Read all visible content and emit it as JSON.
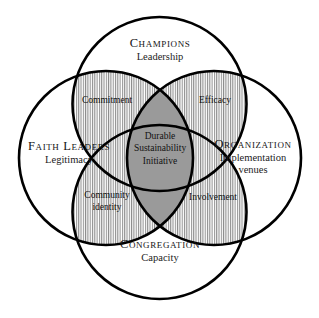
{
  "diagram": {
    "type": "four-circle-venn",
    "background_color": "#ffffff",
    "stroke_color": "#000000",
    "center_fill_color": "#9a9a9a",
    "hatch_color": "#8c8c8c",
    "nodes": [
      {
        "id": "champions",
        "position": "top",
        "title": "Champions",
        "subtitle": "Leadership"
      },
      {
        "id": "faith-leaders",
        "position": "left",
        "title": "Faith Leaders",
        "subtitle": "Legitimacy"
      },
      {
        "id": "organization",
        "position": "right",
        "title": "Organization",
        "subtitle_line1": "Implementation",
        "subtitle_line2": "venues"
      },
      {
        "id": "congregation",
        "position": "bottom",
        "title": "Congregation",
        "subtitle": "Capacity"
      }
    ],
    "intersections": [
      {
        "id": "commitment",
        "position": "top-left",
        "between": [
          "champions",
          "faith-leaders"
        ],
        "label": "Commitment",
        "fill": "hatched"
      },
      {
        "id": "efficacy",
        "position": "top-right",
        "between": [
          "champions",
          "organization"
        ],
        "label": "Efficacy",
        "fill": "hatched"
      },
      {
        "id": "community-identity",
        "position": "bottom-left",
        "between": [
          "faith-leaders",
          "congregation"
        ],
        "label_line1": "Community",
        "label_line2": "identity",
        "fill": "hatched"
      },
      {
        "id": "involvement",
        "position": "bottom-right",
        "between": [
          "organization",
          "congregation"
        ],
        "label": "Involvement",
        "fill": "hatched"
      }
    ],
    "center": {
      "id": "durable-sustainability-initiative",
      "line1": "Durable",
      "line2": "Sustainability",
      "line3": "Initiative",
      "fill": "solid-gray"
    }
  }
}
